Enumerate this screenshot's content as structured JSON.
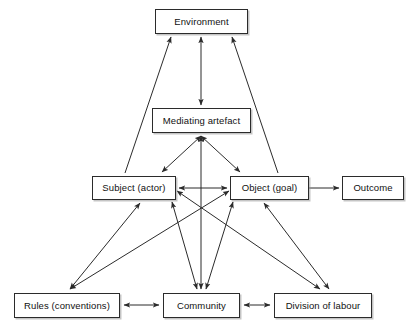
{
  "diagram": {
    "type": "node-link-diagram",
    "canvas": {
      "width": 415,
      "height": 336
    },
    "style": {
      "background_color": "#ffffff",
      "node_border_color": "#2b2b2b",
      "node_fill_color": "#ffffff",
      "edge_color": "#2b2b2b",
      "text_color": "#111111",
      "shadow_color": "#969696"
    },
    "nodes": [
      {
        "id": "environment",
        "label": "Environment",
        "x": 155,
        "y": 9,
        "width": 93,
        "height": 25
      },
      {
        "id": "mediating_artefact",
        "label": "Mediating artefact",
        "x": 152,
        "y": 108,
        "width": 99,
        "height": 25
      },
      {
        "id": "subject",
        "label": "Subject (actor)",
        "x": 92,
        "y": 176,
        "width": 84,
        "height": 24
      },
      {
        "id": "object",
        "label": "Object (goal)",
        "x": 230,
        "y": 176,
        "width": 79,
        "height": 24
      },
      {
        "id": "outcome",
        "label": "Outcome",
        "x": 342,
        "y": 176,
        "width": 62,
        "height": 24
      },
      {
        "id": "rules",
        "label": "Rules (conventions)",
        "x": 14,
        "y": 293,
        "width": 106,
        "height": 25
      },
      {
        "id": "community",
        "label": "Community",
        "x": 163,
        "y": 293,
        "width": 77,
        "height": 25
      },
      {
        "id": "division_of_labour",
        "label": "Division of labour",
        "x": 274,
        "y": 293,
        "width": 98,
        "height": 25
      }
    ],
    "edges": [
      {
        "from": "subject",
        "to": "environment",
        "arrows": "single",
        "direction": "up-right"
      },
      {
        "from": "object",
        "to": "environment",
        "arrows": "single",
        "direction": "up-left"
      },
      {
        "from": "mediating_artefact",
        "to": "environment",
        "arrows": "double",
        "direction": "vertical"
      },
      {
        "from": "mediating_artefact",
        "to": "subject",
        "arrows": "double",
        "direction": "down-left"
      },
      {
        "from": "mediating_artefact",
        "to": "object",
        "arrows": "double",
        "direction": "down-right"
      },
      {
        "from": "mediating_artefact",
        "to": "community",
        "arrows": "double",
        "direction": "vertical"
      },
      {
        "from": "subject",
        "to": "object",
        "arrows": "double",
        "direction": "horizontal"
      },
      {
        "from": "object",
        "to": "outcome",
        "arrows": "single",
        "direction": "right"
      },
      {
        "from": "subject",
        "to": "rules",
        "arrows": "double",
        "direction": "down-left"
      },
      {
        "from": "subject",
        "to": "division_of_labour",
        "arrows": "double",
        "direction": "down-right"
      },
      {
        "from": "object",
        "to": "rules",
        "arrows": "double",
        "direction": "down-left"
      },
      {
        "from": "object",
        "to": "division_of_labour",
        "arrows": "double",
        "direction": "down-right"
      },
      {
        "from": "rules",
        "to": "community",
        "arrows": "double",
        "direction": "horizontal"
      },
      {
        "from": "community",
        "to": "division_of_labour",
        "arrows": "double",
        "direction": "horizontal"
      }
    ]
  }
}
